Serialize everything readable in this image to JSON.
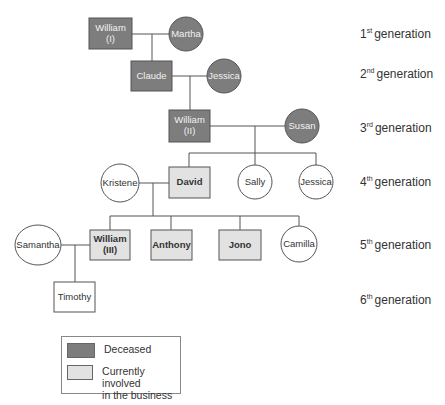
{
  "colors": {
    "deceased": "#7d7d7d",
    "involved": "#e2e2e2",
    "other": "#ffffff",
    "deceased_text": "#f2f2f2",
    "normal_text": "#333333"
  },
  "nodes": [
    {
      "id": "william1",
      "label": [
        "William",
        "(I)"
      ],
      "shape": "rect",
      "status": "deceased"
    },
    {
      "id": "martha",
      "label": [
        "Martha"
      ],
      "shape": "circle",
      "status": "deceased"
    },
    {
      "id": "claude",
      "label": [
        "Claude"
      ],
      "shape": "rect",
      "status": "deceased"
    },
    {
      "id": "jessica2",
      "label": [
        "Jessica"
      ],
      "shape": "circle",
      "status": "deceased"
    },
    {
      "id": "william2",
      "label": [
        "William",
        "(II)"
      ],
      "shape": "rect",
      "status": "deceased"
    },
    {
      "id": "susan",
      "label": [
        "Susan"
      ],
      "shape": "circle",
      "status": "deceased"
    },
    {
      "id": "kristene",
      "label": [
        "Kristene"
      ],
      "shape": "circle",
      "status": "other"
    },
    {
      "id": "david",
      "label": [
        "David"
      ],
      "shape": "rect",
      "status": "involved"
    },
    {
      "id": "sally",
      "label": [
        "Sally"
      ],
      "shape": "circle",
      "status": "other"
    },
    {
      "id": "jessica4",
      "label": [
        "Jessica"
      ],
      "shape": "circle",
      "status": "other"
    },
    {
      "id": "samantha",
      "label": [
        "Samantha"
      ],
      "shape": "circle",
      "status": "other"
    },
    {
      "id": "william3",
      "label": [
        "William",
        "(III)"
      ],
      "shape": "rect",
      "status": "involved"
    },
    {
      "id": "anthony",
      "label": [
        "Anthony"
      ],
      "shape": "rect",
      "status": "involved"
    },
    {
      "id": "jono",
      "label": [
        "Jono"
      ],
      "shape": "rect",
      "status": "involved"
    },
    {
      "id": "camilla",
      "label": [
        "Camilla"
      ],
      "shape": "circle",
      "status": "other"
    },
    {
      "id": "timothy",
      "label": [
        "Timothy"
      ],
      "shape": "rect",
      "status": "other"
    }
  ],
  "generations": [
    {
      "num": "1",
      "suffix": "st",
      "label": "generation"
    },
    {
      "num": "2",
      "suffix": "nd",
      "label": "generation"
    },
    {
      "num": "3",
      "suffix": "rd",
      "label": "generation"
    },
    {
      "num": "4",
      "suffix": "th",
      "label": "generation"
    },
    {
      "num": "5",
      "suffix": "th",
      "label": "generation"
    },
    {
      "num": "6",
      "suffix": "th",
      "label": "generation"
    }
  ],
  "legend": {
    "deceased": "Deceased",
    "involved_line1": "Currently involved",
    "involved_line2": "in the business"
  }
}
